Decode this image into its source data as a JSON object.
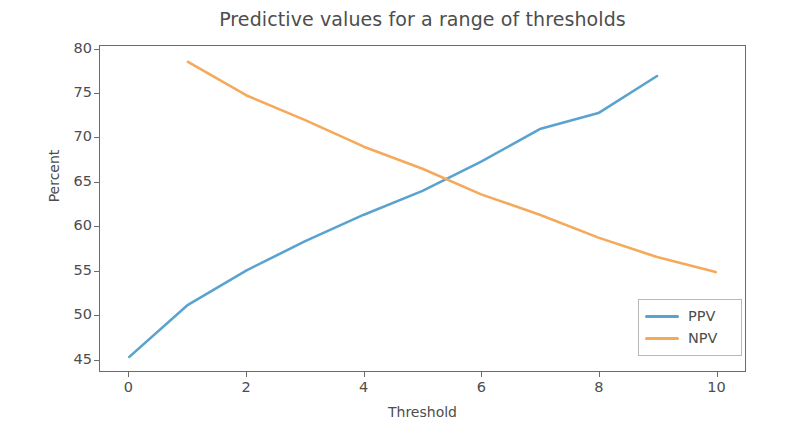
{
  "chart_data": {
    "type": "line",
    "title": "Predictive values for a range of thresholds",
    "xlabel": "Threshold",
    "ylabel": "Percent",
    "xlim": [
      -0.5,
      10.5
    ],
    "ylim": [
      43.6,
      80.4
    ],
    "xticks": [
      "0",
      "2",
      "4",
      "6",
      "8",
      "10"
    ],
    "xtick_values": [
      0,
      2,
      4,
      6,
      8,
      10
    ],
    "yticks": [
      "45",
      "50",
      "55",
      "60",
      "65",
      "70",
      "75",
      "80"
    ],
    "ytick_values": [
      45,
      50,
      55,
      60,
      65,
      70,
      75,
      80
    ],
    "grid": false,
    "legend_position": "lower right",
    "series": [
      {
        "name": "PPV",
        "color": "#5ba3cf",
        "x": [
          0,
          1,
          2,
          3,
          4,
          5,
          6,
          7,
          8,
          9
        ],
        "values": [
          45.2,
          51.1,
          55.0,
          58.3,
          61.3,
          64.0,
          67.3,
          71.0,
          72.8,
          77.0
        ]
      },
      {
        "name": "NPV",
        "color": "#f5a95c",
        "x": [
          1,
          2,
          3,
          4,
          5,
          6,
          7,
          8,
          9,
          10
        ],
        "values": [
          78.6,
          74.8,
          72.0,
          69.0,
          66.5,
          63.6,
          61.3,
          58.7,
          56.5,
          54.8
        ]
      }
    ]
  },
  "legend": {
    "entries": [
      {
        "label": "PPV"
      },
      {
        "label": "NPV"
      }
    ]
  },
  "colors": {
    "ppv": "#5ba3cf",
    "npv": "#f5a95c",
    "axis": "#6b6b6b",
    "text": "#4d4d4d",
    "background": "#ffffff"
  }
}
